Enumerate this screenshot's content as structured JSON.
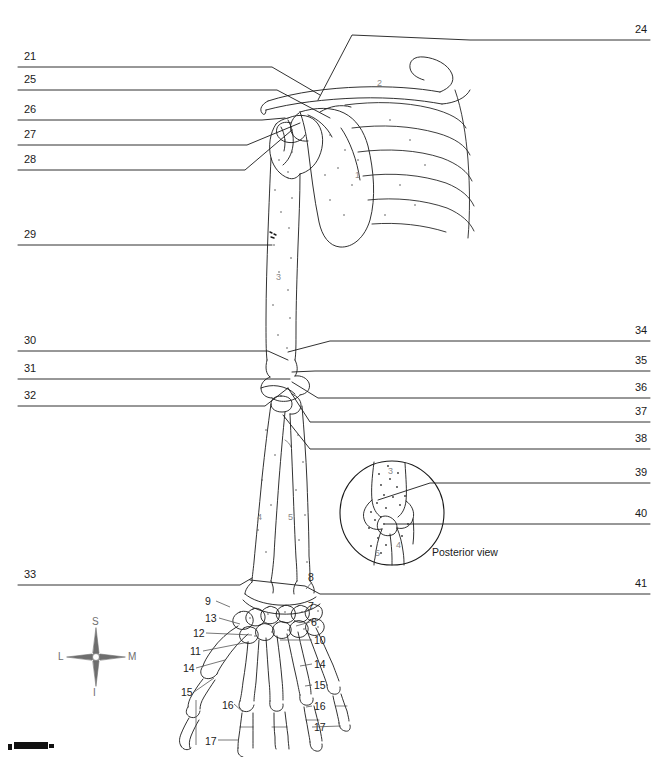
{
  "figure": {
    "view": "Anterior view of right upper limb with posterior elbow inset",
    "background_color": "#ffffff",
    "line_color": "#1a1a1a",
    "bone_number_color": "#8a8a8a"
  },
  "left_labels": [
    {
      "number": "21",
      "y": 57
    },
    {
      "number": "25",
      "y": 80
    },
    {
      "number": "26",
      "y": 110
    },
    {
      "number": "27",
      "y": 135
    },
    {
      "number": "28",
      "y": 160
    },
    {
      "number": "29",
      "y": 235
    },
    {
      "number": "30",
      "y": 341
    },
    {
      "number": "31",
      "y": 369
    },
    {
      "number": "32",
      "y": 396
    },
    {
      "number": "33",
      "y": 575
    }
  ],
  "right_labels": [
    {
      "number": "24",
      "y": 30
    },
    {
      "number": "34",
      "y": 331
    },
    {
      "number": "35",
      "y": 361
    },
    {
      "number": "36",
      "y": 388
    },
    {
      "number": "37",
      "y": 412
    },
    {
      "number": "38",
      "y": 439
    },
    {
      "number": "39",
      "y": 473
    },
    {
      "number": "40",
      "y": 514
    },
    {
      "number": "41",
      "y": 584
    }
  ],
  "hand_callouts": [
    {
      "number": "8",
      "x": 308,
      "y": 572
    },
    {
      "number": "9",
      "x": 205,
      "y": 596
    },
    {
      "number": "7",
      "x": 308,
      "y": 601
    },
    {
      "number": "13",
      "x": 205,
      "y": 613
    },
    {
      "number": "6",
      "x": 311,
      "y": 617
    },
    {
      "number": "12",
      "x": 193,
      "y": 628
    },
    {
      "number": "10",
      "x": 314,
      "y": 635
    },
    {
      "number": "11",
      "x": 190,
      "y": 646
    },
    {
      "number": "14",
      "x": 314,
      "y": 659
    },
    {
      "number": "14",
      "x": 183,
      "y": 663
    },
    {
      "number": "15",
      "x": 314,
      "y": 680
    },
    {
      "number": "15",
      "x": 181,
      "y": 687
    },
    {
      "number": "16",
      "x": 222,
      "y": 700
    },
    {
      "number": "16",
      "x": 314,
      "y": 701
    },
    {
      "number": "17",
      "x": 314,
      "y": 722
    },
    {
      "number": "17",
      "x": 205,
      "y": 736
    }
  ],
  "bone_numbers": [
    {
      "number": "1",
      "x": 355,
      "y": 175
    },
    {
      "number": "2",
      "x": 377,
      "y": 83
    },
    {
      "number": "3",
      "x": 276,
      "y": 277
    },
    {
      "number": "4",
      "x": 257,
      "y": 517
    },
    {
      "number": "5",
      "x": 288,
      "y": 517
    }
  ],
  "inset": {
    "caption": "Posterior view",
    "center_x": 392,
    "center_y": 513,
    "radius": 52,
    "bone_numbers": [
      {
        "number": "3",
        "x": 388,
        "y": 471
      },
      {
        "number": "4",
        "x": 396,
        "y": 545
      },
      {
        "number": "5",
        "x": 375,
        "y": 553
      }
    ]
  },
  "compass": {
    "superior": "S",
    "inferior": "I",
    "lateral": "L",
    "medial": "M",
    "center_x": 96,
    "center_y": 657
  }
}
